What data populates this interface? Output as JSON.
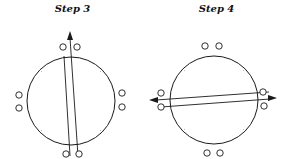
{
  "steps": [
    {
      "title": "Step 3",
      "orientation": "vertical",
      "arrow_direction": "up",
      "marker_pairs": [
        "top",
        "bottom",
        "left",
        "right"
      ]
    },
    {
      "title": "Step 4",
      "orientation": "horizontal",
      "arrow_direction": "left-and-right",
      "marker_pairs": [
        "top",
        "bottom",
        "left",
        "right"
      ]
    }
  ],
  "colors": {
    "stroke": "#1a1a1a",
    "background": "#ffffff"
  }
}
